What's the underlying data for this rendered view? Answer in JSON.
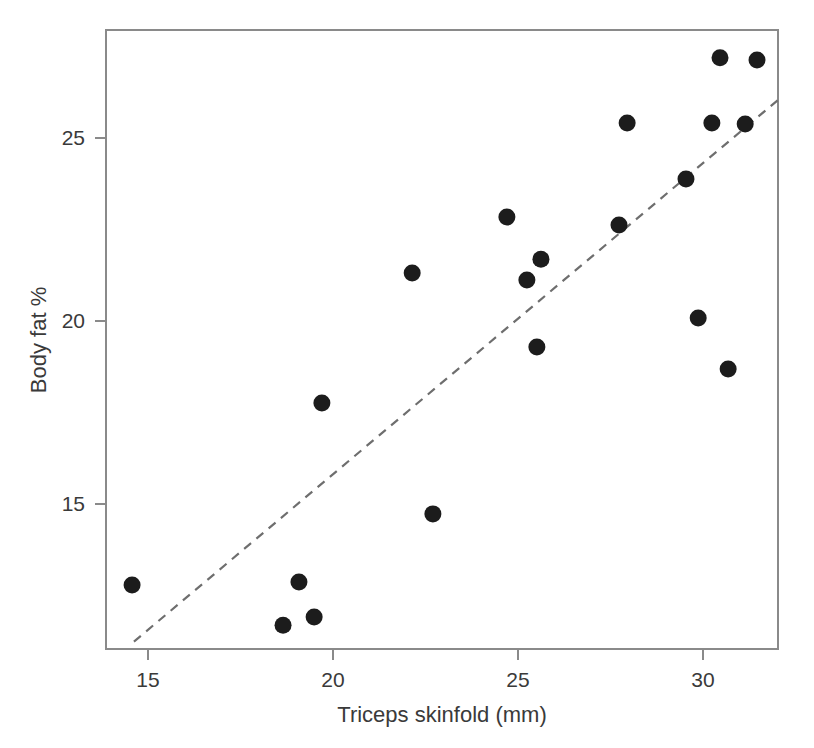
{
  "chart_data": {
    "type": "scatter",
    "title": "",
    "xlabel": "Triceps skinfold (mm)",
    "ylabel": "Body fat %",
    "xlim": [
      13.85,
      32.05
    ],
    "ylim": [
      11.2,
      27.8
    ],
    "grid": false,
    "legend": "none",
    "xticks": [
      15,
      20,
      25,
      30
    ],
    "xtick_labels": [
      "15",
      "20",
      "25",
      "30"
    ],
    "yticks": [
      15,
      20,
      25
    ],
    "ytick_labels": [
      "15",
      "20",
      "25"
    ],
    "marker": "filled-circle",
    "marker_color": "#1c1c1c",
    "points": [
      {
        "x": 14.57,
        "y": 12.79
      },
      {
        "x": 18.65,
        "y": 11.69
      },
      {
        "x": 19.08,
        "y": 12.87
      },
      {
        "x": 19.49,
        "y": 11.91
      },
      {
        "x": 19.7,
        "y": 17.76
      },
      {
        "x": 22.14,
        "y": 21.31
      },
      {
        "x": 22.7,
        "y": 14.73
      },
      {
        "x": 24.7,
        "y": 22.84
      },
      {
        "x": 25.24,
        "y": 21.12
      },
      {
        "x": 25.51,
        "y": 19.29
      },
      {
        "x": 25.62,
        "y": 21.69
      },
      {
        "x": 27.73,
        "y": 22.62
      },
      {
        "x": 27.95,
        "y": 25.41
      },
      {
        "x": 29.54,
        "y": 23.88
      },
      {
        "x": 29.87,
        "y": 20.08
      },
      {
        "x": 30.24,
        "y": 25.41
      },
      {
        "x": 30.46,
        "y": 27.19
      },
      {
        "x": 30.68,
        "y": 18.69
      },
      {
        "x": 31.14,
        "y": 25.38
      },
      {
        "x": 31.46,
        "y": 27.13
      }
    ],
    "series": [
      {
        "name": "Triceps skinfold vs Body fat",
        "x": [
          14.57,
          18.65,
          19.08,
          19.49,
          19.7,
          22.14,
          22.7,
          24.7,
          25.24,
          25.51,
          25.62,
          27.73,
          27.95,
          29.54,
          29.87,
          30.24,
          30.46,
          30.68,
          31.14,
          31.46
        ],
        "y": [
          12.79,
          11.69,
          12.87,
          11.91,
          17.76,
          21.31,
          14.73,
          22.84,
          21.12,
          19.29,
          21.69,
          22.62,
          25.41,
          23.88,
          20.08,
          25.41,
          27.19,
          18.69,
          25.38,
          27.13
        ]
      }
    ],
    "trend_line": {
      "style": "dashed",
      "color": "#6e6e6e",
      "x_start": 14.62,
      "y_start": 11.24,
      "x_end": 32.03,
      "y_end": 26.04
    }
  }
}
